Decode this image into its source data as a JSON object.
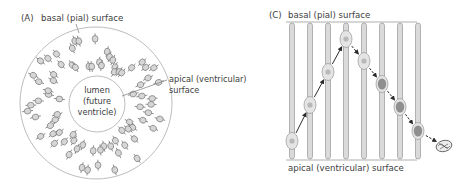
{
  "panel_a": {
    "label": "(A)",
    "basal_label": "basal (pial) surface",
    "apical_label_line1": "apical (ventricular)",
    "apical_label_line2": "surface",
    "lumen_line1": "lumen",
    "lumen_line2": "(future",
    "lumen_line3": "ventricle)",
    "outer_circle": {
      "cx": 96,
      "cy": 103,
      "r": 76
    },
    "inner_circle": {
      "cx": 97,
      "cy": 104,
      "r": 28
    },
    "colors": {
      "outline": "#b8b8b8",
      "cell_fill": "#d6d6d6",
      "cell_stroke": "#6a6a6a"
    }
  },
  "panel_c": {
    "label": "(C)",
    "basal_label": "basal (pial) surface",
    "apical_label": "apical (ventricular) surface",
    "columns_x": [
      292,
      310,
      328,
      346,
      364,
      382,
      400,
      418
    ],
    "nucleus_y": [
      141,
      105,
      72,
      39,
      61,
      84,
      107,
      131
    ],
    "dividing_cell": {
      "x": 444,
      "y": 146
    },
    "basal_y": 22,
    "apical_y": 160,
    "colors": {
      "column_fill": "#dadada",
      "column_stroke": "#8a8a8a",
      "nucleus_light": "#b8b8b8",
      "nucleus_dark": "#8f8f8f",
      "arrow": "#2b2b2b"
    }
  }
}
